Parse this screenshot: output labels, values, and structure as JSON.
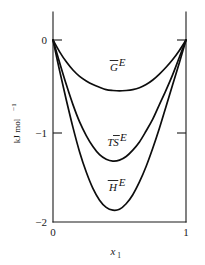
{
  "chart_data": {
    "type": "line",
    "title": "",
    "subtitle": "",
    "xlabel": "x_1",
    "xlabel_base": "x",
    "xlabel_sub": "1",
    "ylabel": "kJ mol−1",
    "ylabel_base": "kJ mol",
    "ylabel_sup": "−1",
    "xlim": [
      0,
      1
    ],
    "ylim": [
      -2,
      0
    ],
    "xticks": [
      0,
      1
    ],
    "xticklabels": [
      "0",
      "1"
    ],
    "yticks": [
      0,
      -1,
      -2
    ],
    "yticklabels": [
      "0",
      "−1",
      "−2"
    ],
    "grid": false,
    "legend": "inline-annotations",
    "frame": "box",
    "tick_direction": "in",
    "series": [
      {
        "name": "G-bar-E",
        "label_base": "G",
        "label_sup": "E",
        "overbar": true,
        "label_x": 0.46,
        "label_y": -0.29,
        "x": [
          0.0,
          0.05,
          0.1,
          0.15,
          0.2,
          0.25,
          0.3,
          0.35,
          0.4,
          0.45,
          0.5,
          0.55,
          0.6,
          0.65,
          0.7,
          0.75,
          0.8,
          0.85,
          0.9,
          0.95,
          1.0
        ],
        "values": [
          0.0,
          -0.13,
          -0.24,
          -0.33,
          -0.4,
          -0.45,
          -0.49,
          -0.52,
          -0.545,
          -0.555,
          -0.56,
          -0.555,
          -0.545,
          -0.525,
          -0.49,
          -0.44,
          -0.375,
          -0.3,
          -0.215,
          -0.115,
          0.0
        ]
      },
      {
        "name": "TS-bar-E",
        "label_base": "TS",
        "label_sup": "E",
        "overbar": true,
        "label_x": 0.46,
        "label_y": -1.07,
        "x": [
          0.0,
          0.05,
          0.1,
          0.15,
          0.2,
          0.25,
          0.3,
          0.35,
          0.4,
          0.45,
          0.5,
          0.55,
          0.6,
          0.65,
          0.7,
          0.75,
          0.8,
          0.85,
          0.9,
          0.95,
          1.0
        ],
        "values": [
          0.0,
          -0.25,
          -0.49,
          -0.71,
          -0.9,
          -1.05,
          -1.17,
          -1.26,
          -1.31,
          -1.33,
          -1.32,
          -1.28,
          -1.21,
          -1.12,
          -1.0,
          -0.87,
          -0.71,
          -0.55,
          -0.38,
          -0.19,
          0.0
        ]
      },
      {
        "name": "H-bar-E",
        "label_base": "H",
        "label_sup": "E",
        "overbar": true,
        "label_x": 0.45,
        "label_y": -1.56,
        "x": [
          0.0,
          0.05,
          0.1,
          0.15,
          0.2,
          0.25,
          0.3,
          0.35,
          0.4,
          0.45,
          0.5,
          0.55,
          0.6,
          0.65,
          0.7,
          0.75,
          0.8,
          0.85,
          0.9,
          0.95,
          1.0
        ],
        "values": [
          0.0,
          -0.34,
          -0.66,
          -0.96,
          -1.23,
          -1.45,
          -1.63,
          -1.76,
          -1.84,
          -1.87,
          -1.86,
          -1.8,
          -1.7,
          -1.56,
          -1.39,
          -1.19,
          -0.97,
          -0.73,
          -0.49,
          -0.25,
          0.0
        ]
      }
    ]
  },
  "colors": {
    "curve": "#0d0d0d",
    "axis": "#1a1a1a",
    "background": "#ffffff",
    "text": "#111111"
  }
}
